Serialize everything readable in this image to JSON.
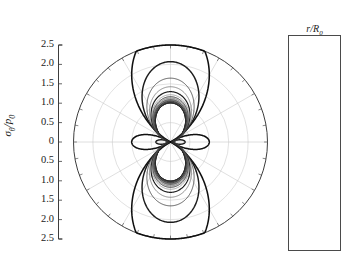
{
  "chart_data": {
    "type": "line",
    "plot_kind": "polar",
    "title": "",
    "ylabel": "σθ/p0",
    "ylabel_parts": {
      "symbol": "σ",
      "sub": "θ",
      "denom": "p",
      "denom_sub": "0"
    },
    "legend_title": "r/R0",
    "legend_title_parts": {
      "numer": "r",
      "denom": "R",
      "denom_sub": "0"
    },
    "legend_position": "right-outside",
    "grid": true,
    "radial_axis": {
      "label": "σθ/p0",
      "ticks": [
        "2.5",
        "2.0",
        "1.5",
        "1.0",
        "0.5",
        "0",
        "0.5",
        "1.0",
        "1.5",
        "2.0",
        "2.5"
      ],
      "rmax": 2.5,
      "rmin": 0,
      "grid_circles": [
        0.5,
        1.0,
        1.5,
        2.0,
        2.5
      ]
    },
    "angular_axis": {
      "labels": [
        "0",
        "30",
        "60",
        "90",
        "120",
        "150",
        "180",
        "210",
        "240",
        "270",
        "300",
        "330"
      ],
      "values_deg": [
        0,
        30,
        60,
        90,
        120,
        150,
        180,
        210,
        240,
        270,
        300,
        330
      ],
      "direction": "counterclockwise",
      "zero_at": "east"
    },
    "series": [
      {
        "name": "1.0",
        "r_over_R0": 1.0,
        "shade": "#101010",
        "width": 1.55
      },
      {
        "name": "1.2",
        "r_over_R0": 1.2,
        "shade": "#1c1c1c",
        "width": 1.45
      },
      {
        "name": "1.4",
        "r_over_R0": 1.4,
        "shade": "#404040",
        "width": 0.85
      },
      {
        "name": "1.6",
        "r_over_R0": 1.6,
        "shade": "#6e6e6e",
        "width": 0.8
      },
      {
        "name": "1.8",
        "r_over_R0": 1.8,
        "shade": "#1e1e1e",
        "width": 1.2
      },
      {
        "name": "2.0",
        "r_over_R0": 2.0,
        "shade": "#8a8a8a",
        "width": 0.75
      },
      {
        "name": "2.2",
        "r_over_R0": 2.2,
        "shade": "#2a2a2a",
        "width": 0.95
      },
      {
        "name": "2.4",
        "r_over_R0": 2.4,
        "shade": "#555555",
        "width": 0.8
      },
      {
        "name": "2.6",
        "r_over_R0": 2.6,
        "shade": "#7d7d7d",
        "width": 0.75
      },
      {
        "name": "2.8",
        "r_over_R0": 2.8,
        "shade": "#2f2f2f",
        "width": 0.9
      },
      {
        "name": "3.0",
        "r_over_R0": 3.0,
        "shade": "#5c5c5c",
        "width": 0.8
      },
      {
        "name": "3.2",
        "r_over_R0": 3.2,
        "shade": "#888888",
        "width": 0.7
      },
      {
        "name": "3.4",
        "r_over_R0": 3.4,
        "shade": "#333333",
        "width": 0.85
      },
      {
        "name": "3.6",
        "r_over_R0": 3.6,
        "shade": "#626262",
        "width": 0.75
      },
      {
        "name": "3.8",
        "r_over_R0": 3.8,
        "shade": "#909090",
        "width": 0.7
      },
      {
        "name": "4.0",
        "r_over_R0": 4.0,
        "shade": "#1a1a1a",
        "width": 1.1
      },
      {
        "name": "4.2",
        "r_over_R0": 4.2,
        "shade": "#3d3d3d",
        "width": 0.85
      },
      {
        "name": "4.4",
        "r_over_R0": 4.4,
        "shade": "#9a9a9a",
        "width": 0.7
      },
      {
        "name": "4.6",
        "r_over_R0": 4.6,
        "shade": "#6a6a6a",
        "width": 0.75
      },
      {
        "name": "5.0",
        "r_over_R0": 5.0,
        "shade": "#2b2b2b",
        "width": 0.95
      },
      {
        "name": "5.4",
        "r_over_R0": 5.4,
        "shade": "#808080",
        "width": 0.7
      },
      {
        "name": "6.0",
        "r_over_R0": 6.0,
        "shade": "#4a4a4a",
        "width": 0.8
      },
      {
        "name": "7.0",
        "r_over_R0": 7.0,
        "shade": "#303030",
        "width": 0.85
      },
      {
        "name": "8.0",
        "r_over_R0": 8.0,
        "shade": "#565656",
        "width": 0.8
      },
      {
        "name": "9.0",
        "r_over_R0": 9.0,
        "shade": "#3a3a3a",
        "width": 0.85
      },
      {
        "name": "10.0",
        "r_over_R0": 10.0,
        "shade": "#202020",
        "width": 0.95
      }
    ],
    "legend_entries": [
      "1.0",
      "1.2",
      "1.4",
      "1.6",
      "1.8",
      "2.0",
      "2.2",
      "2.4",
      "2.6",
      "2.8",
      "3.0",
      "3.2",
      "3.4",
      "3.6",
      "3.8",
      "4.0",
      "4.2",
      "4.4",
      "4.6",
      "5.0",
      "5.4",
      "6.0",
      "7.0",
      "8.0",
      "9.0",
      "10.0"
    ]
  },
  "axis": {
    "y_ticks": [
      "2.5",
      "2.0",
      "1.5",
      "1.0",
      "0.5",
      "0",
      "0.5",
      "1.0",
      "1.5",
      "2.0",
      "2.5"
    ]
  },
  "polar_labels": [
    {
      "text": "0",
      "deg": 0
    },
    {
      "text": "30",
      "deg": 30
    },
    {
      "text": "60",
      "deg": 60
    },
    {
      "text": "90",
      "deg": 90
    },
    {
      "text": "120",
      "deg": 120
    },
    {
      "text": "150",
      "deg": 150
    },
    {
      "text": "180",
      "deg": 180
    },
    {
      "text": "210",
      "deg": 210
    },
    {
      "text": "240",
      "deg": 240
    },
    {
      "text": "270",
      "deg": 270
    },
    {
      "text": "300",
      "deg": 300
    },
    {
      "text": "330",
      "deg": 330
    }
  ]
}
